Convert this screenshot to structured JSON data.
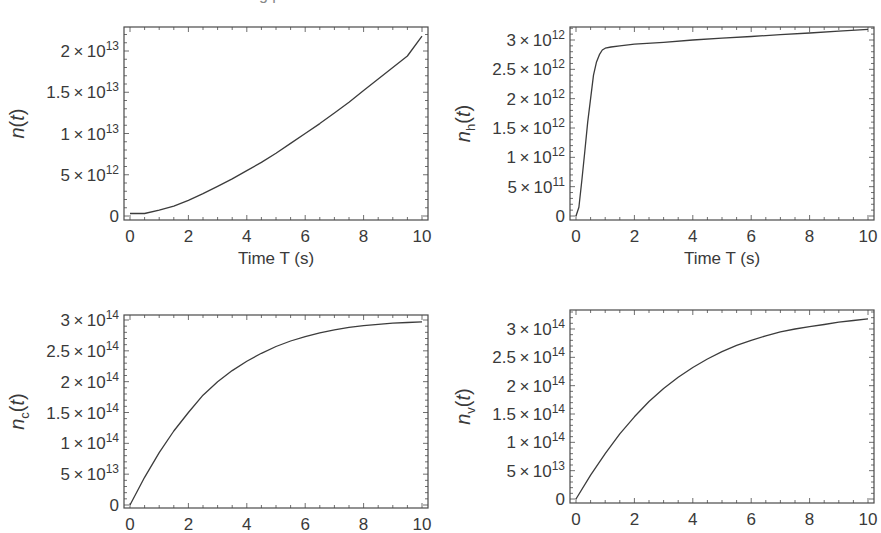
{
  "figure": {
    "cut_caption": "g   p"
  },
  "chart_data": [
    {
      "id": "n",
      "type": "line",
      "title": "",
      "ylabel": "n(t)",
      "ylabel_main": "n",
      "ylabel_sub": "",
      "xlabel": "Time T (s)",
      "xlim": [
        0,
        10
      ],
      "ylim": [
        0,
        22000000000000.0
      ],
      "grid": false,
      "x_ticks": [
        0,
        2,
        4,
        6,
        8,
        10
      ],
      "y_ticks": [
        {
          "value": 0,
          "label": "0"
        },
        {
          "value": 5000000000000.0,
          "mant": "5",
          "exp": "12"
        },
        {
          "value": 10000000000000.0,
          "mant": "1",
          "exp": "13"
        },
        {
          "value": 15000000000000.0,
          "mant": "1.5",
          "exp": "13"
        },
        {
          "value": 20000000000000.0,
          "mant": "2",
          "exp": "13"
        }
      ],
      "x": [
        0,
        0.5,
        1,
        1.5,
        2,
        2.5,
        3,
        3.5,
        4,
        4.5,
        5,
        5.5,
        6,
        6.5,
        7,
        7.5,
        8,
        8.5,
        9,
        9.5,
        10
      ],
      "y": [
        300000000000.0,
        300000000000.0,
        700000000000.0,
        1200000000000.0,
        1900000000000.0,
        2700000000000.0,
        3600000000000.0,
        4500000000000.0,
        5500000000000.0,
        6500000000000.0,
        7600000000000.0,
        8800000000000.0,
        10000000000000.0,
        11200000000000.0,
        12500000000000.0,
        13800000000000.0,
        15200000000000.0,
        16600000000000.0,
        18000000000000.0,
        19400000000000.0,
        21800000000000.0
      ],
      "frame": {
        "left": 124,
        "top": 27,
        "right": 428,
        "bottom": 220
      },
      "y_pix": {
        "zero": 216,
        "max_tick_value": 20000000000000.0,
        "max_tick_pix": 51
      }
    },
    {
      "id": "nh",
      "type": "line",
      "title": "",
      "ylabel": "n_h(t)",
      "ylabel_main": "n",
      "ylabel_sub": "h",
      "xlabel": "Time T (s)",
      "xlim": [
        0,
        10
      ],
      "ylim": [
        0,
        3200000000000.0
      ],
      "grid": false,
      "x_ticks": [
        0,
        2,
        4,
        6,
        8,
        10
      ],
      "y_ticks": [
        {
          "value": 0,
          "label": "0"
        },
        {
          "value": 500000000000.0,
          "mant": "5",
          "exp": "11"
        },
        {
          "value": 1000000000000.0,
          "mant": "1",
          "exp": "12"
        },
        {
          "value": 1500000000000.0,
          "mant": "1.5",
          "exp": "12"
        },
        {
          "value": 2000000000000.0,
          "mant": "2",
          "exp": "12"
        },
        {
          "value": 2500000000000.0,
          "mant": "2.5",
          "exp": "12"
        },
        {
          "value": 3000000000000.0,
          "mant": "3",
          "exp": "12"
        }
      ],
      "x": [
        0,
        0.1,
        0.2,
        0.3,
        0.4,
        0.5,
        0.6,
        0.7,
        0.8,
        0.9,
        1.0,
        1.2,
        1.5,
        2,
        3,
        4,
        5,
        6,
        7,
        8,
        9,
        10
      ],
      "y": [
        0,
        150000000000.0,
        600000000000.0,
        1100000000000.0,
        1600000000000.0,
        2000000000000.0,
        2400000000000.0,
        2620000000000.0,
        2750000000000.0,
        2830000000000.0,
        2860000000000.0,
        2880000000000.0,
        2900000000000.0,
        2930000000000.0,
        2960000000000.0,
        3000000000000.0,
        3030000000000.0,
        3060000000000.0,
        3090000000000.0,
        3120000000000.0,
        3150000000000.0,
        3180000000000.0
      ],
      "frame": {
        "left": 570,
        "top": 27,
        "right": 874,
        "bottom": 220
      },
      "y_pix": {
        "zero": 216,
        "max_tick_value": 3000000000000.0,
        "max_tick_pix": 40
      }
    },
    {
      "id": "nc",
      "type": "line",
      "title": "",
      "ylabel": "n_c(t)",
      "ylabel_main": "n",
      "ylabel_sub": "c",
      "xlabel": "",
      "xlim": [
        0,
        10
      ],
      "ylim": [
        0,
        305000000000000.0
      ],
      "grid": false,
      "x_ticks": [
        0,
        2,
        4,
        6,
        8,
        10
      ],
      "y_ticks": [
        {
          "value": 0,
          "label": "0"
        },
        {
          "value": 50000000000000.0,
          "mant": "5",
          "exp": "13"
        },
        {
          "value": 100000000000000.0,
          "mant": "1",
          "exp": "14"
        },
        {
          "value": 150000000000000.0,
          "mant": "1.5",
          "exp": "14"
        },
        {
          "value": 200000000000000.0,
          "mant": "2",
          "exp": "14"
        },
        {
          "value": 250000000000000.0,
          "mant": "2.5",
          "exp": "14"
        },
        {
          "value": 300000000000000.0,
          "mant": "3",
          "exp": "14"
        }
      ],
      "x": [
        0,
        0.5,
        1,
        1.5,
        2,
        2.5,
        3,
        3.5,
        4,
        4.5,
        5,
        5.5,
        6,
        6.5,
        7,
        7.5,
        8,
        8.5,
        9,
        9.5,
        10
      ],
      "y": [
        0,
        45000000000000.0,
        85000000000000.0,
        120000000000000.0,
        150000000000000.0,
        178000000000000.0,
        200000000000000.0,
        218000000000000.0,
        233000000000000.0,
        246000000000000.0,
        257000000000000.0,
        266000000000000.0,
        273000000000000.0,
        279000000000000.0,
        284000000000000.0,
        288000000000000.0,
        291000000000000.0,
        293000000000000.0,
        295000000000000.0,
        296000000000000.0,
        297000000000000.0
      ],
      "frame": {
        "left": 124,
        "top": 315,
        "right": 428,
        "bottom": 508
      },
      "y_pix": {
        "zero": 505,
        "max_tick_value": 300000000000000.0,
        "max_tick_pix": 320
      }
    },
    {
      "id": "nv",
      "type": "line",
      "title": "",
      "ylabel": "n_v(t)",
      "ylabel_main": "n",
      "ylabel_sub": "v",
      "xlabel": "",
      "xlim": [
        0,
        10
      ],
      "ylim": [
        0,
        325000000000000.0
      ],
      "grid": false,
      "x_ticks": [
        0,
        2,
        4,
        6,
        8,
        10
      ],
      "y_ticks": [
        {
          "value": 0,
          "label": "0"
        },
        {
          "value": 50000000000000.0,
          "mant": "5",
          "exp": "13"
        },
        {
          "value": 100000000000000.0,
          "mant": "1",
          "exp": "14"
        },
        {
          "value": 150000000000000.0,
          "mant": "1.5",
          "exp": "14"
        },
        {
          "value": 200000000000000.0,
          "mant": "2",
          "exp": "14"
        },
        {
          "value": 250000000000000.0,
          "mant": "2.5",
          "exp": "14"
        },
        {
          "value": 300000000000000.0,
          "mant": "3",
          "exp": "14"
        }
      ],
      "x": [
        0,
        0.5,
        1,
        1.5,
        2,
        2.5,
        3,
        3.5,
        4,
        4.5,
        5,
        5.5,
        6,
        6.5,
        7,
        7.5,
        8,
        8.5,
        9,
        9.5,
        10
      ],
      "y": [
        0,
        42000000000000.0,
        80000000000000.0,
        115000000000000.0,
        145000000000000.0,
        172000000000000.0,
        195000000000000.0,
        215000000000000.0,
        232000000000000.0,
        247000000000000.0,
        260000000000000.0,
        271000000000000.0,
        280000000000000.0,
        288000000000000.0,
        295000000000000.0,
        300000000000000.0,
        304000000000000.0,
        308000000000000.0,
        312000000000000.0,
        315000000000000.0,
        318000000000000.0
      ],
      "frame": {
        "left": 570,
        "top": 310,
        "right": 874,
        "bottom": 503
      },
      "y_pix": {
        "zero": 499,
        "max_tick_value": 300000000000000.0,
        "max_tick_pix": 329
      }
    }
  ]
}
